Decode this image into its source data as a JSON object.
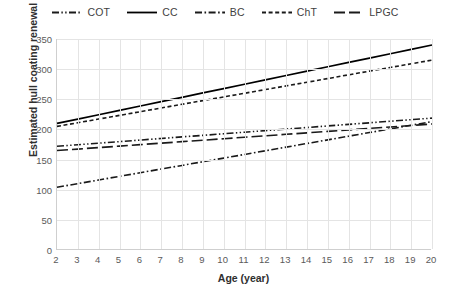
{
  "chart_data": {
    "type": "line",
    "title": "",
    "xlabel": "Age (year)",
    "ylabel": "Estimated hull coating renewal area (%)",
    "xlim": [
      2,
      20
    ],
    "ylim": [
      0,
      350
    ],
    "xticks": [
      2,
      3,
      4,
      5,
      6,
      7,
      8,
      9,
      10,
      11,
      12,
      13,
      14,
      15,
      16,
      17,
      18,
      19,
      20
    ],
    "yticks": [
      0,
      50,
      100,
      150,
      200,
      250,
      300,
      350
    ],
    "grid": "horizontal-and-vertical",
    "legend_position": "top-center",
    "x": [
      2,
      3,
      4,
      5,
      6,
      7,
      8,
      9,
      10,
      11,
      12,
      13,
      14,
      15,
      16,
      17,
      18,
      19,
      20
    ],
    "series": [
      {
        "name": "COT",
        "style": "dash-dot-dot",
        "color": "#1a1a1a",
        "values": [
          172,
          174.6,
          177.2,
          179.8,
          182.4,
          185,
          187.6,
          190.2,
          192.8,
          195.4,
          198,
          200.6,
          203.2,
          205.8,
          208.4,
          211,
          213.6,
          216.2,
          218.8
        ]
      },
      {
        "name": "CC",
        "style": "solid",
        "color": "#000000",
        "values": [
          210,
          217.2,
          224.4,
          231.7,
          238.9,
          246.1,
          253.3,
          260.6,
          267.8,
          275,
          282.2,
          289.4,
          296.7,
          303.9,
          311.1,
          318.3,
          325.6,
          332.8,
          340
        ]
      },
      {
        "name": "BC",
        "style": "dash-dot",
        "color": "#1a1a1a",
        "values": [
          104,
          110.1,
          116.1,
          122.2,
          128.2,
          134.3,
          140.3,
          146.4,
          152.4,
          158.5,
          164.6,
          170.6,
          176.7,
          182.7,
          188.8,
          194.8,
          200.9,
          206.9,
          213
        ]
      },
      {
        "name": "ChT",
        "style": "dashed",
        "color": "#1a1a1a",
        "values": [
          205,
          211.1,
          217.2,
          223.3,
          229.4,
          235.6,
          241.7,
          247.8,
          253.9,
          260,
          266.1,
          272.2,
          278.3,
          284.4,
          290.6,
          296.7,
          302.8,
          308.9,
          315
        ]
      },
      {
        "name": "LPGC",
        "style": "long-dash",
        "color": "#1a1a1a",
        "values": [
          165,
          167.4,
          169.9,
          172.3,
          174.8,
          177.2,
          179.7,
          182.1,
          184.6,
          187,
          189.4,
          191.9,
          194.3,
          196.8,
          199.2,
          201.7,
          204.1,
          206.6,
          209
        ]
      }
    ]
  },
  "legend": {
    "items": [
      {
        "label": "COT"
      },
      {
        "label": "CC"
      },
      {
        "label": "BC"
      },
      {
        "label": "ChT"
      },
      {
        "label": "LPGC"
      }
    ]
  }
}
